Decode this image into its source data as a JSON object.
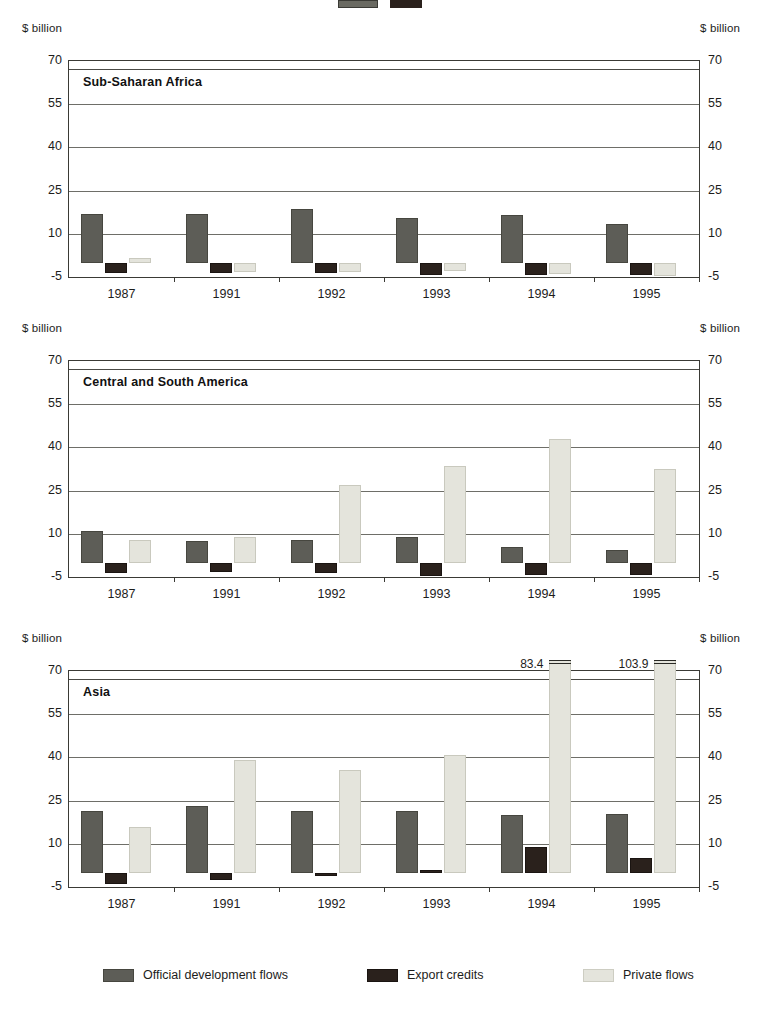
{
  "figure": {
    "unit_label_left": "$ billion",
    "unit_label_right": "$ billion",
    "top_marker": {
      "swatch_a": "odf-swatch",
      "swatch_b": "export-swatch"
    }
  },
  "legend": {
    "position": "bottom",
    "items": [
      {
        "key": "odf",
        "label": "Official development flows",
        "color": "#5d5d57"
      },
      {
        "key": "exp",
        "label": "Export credits",
        "color": "#2a211c"
      },
      {
        "key": "priv",
        "label": "Private flows",
        "color": "#e4e4dc"
      }
    ]
  },
  "axis": {
    "yticks": [
      70,
      55,
      40,
      25,
      10,
      -5
    ],
    "ytick_labels": [
      "70",
      "55",
      "40",
      "25",
      "10",
      "-5"
    ],
    "ylim": [
      -5,
      70
    ],
    "categories": [
      "1987",
      "1991",
      "1992",
      "1993",
      "1994",
      "1995"
    ],
    "ylabel": "$ billion",
    "grid": true
  },
  "chart_data": [
    {
      "type": "bar",
      "title": "Sub-Saharan Africa",
      "xlabel": "",
      "ylabel": "$ billion",
      "ylim": [
        -5,
        70
      ],
      "yticks": [
        70,
        55,
        40,
        25,
        10,
        -5
      ],
      "grid": true,
      "legend_position": "bottom",
      "categories": [
        "1987",
        "1991",
        "1992",
        "1993",
        "1994",
        "1995"
      ],
      "series": [
        {
          "name": "Official development flows",
          "color": "#5d5d57",
          "values": [
            17.0,
            17.0,
            18.5,
            15.5,
            16.5,
            13.5
          ]
        },
        {
          "name": "Export credits",
          "color": "#2a211c",
          "values": [
            -3.7,
            -3.7,
            -3.6,
            -4.2,
            -4.4,
            -4.3
          ]
        },
        {
          "name": "Private flows",
          "color": "#e4e4dc",
          "values": [
            1.5,
            -3.1,
            -3.3,
            -2.8,
            -4.1,
            -4.5
          ]
        }
      ]
    },
    {
      "type": "bar",
      "title": "Central and South America",
      "xlabel": "",
      "ylabel": "$ billion",
      "ylim": [
        -5,
        70
      ],
      "yticks": [
        70,
        55,
        40,
        25,
        10,
        -5
      ],
      "grid": true,
      "legend_position": "bottom",
      "categories": [
        "1987",
        "1991",
        "1992",
        "1993",
        "1994",
        "1995"
      ],
      "series": [
        {
          "name": "Official development flows",
          "color": "#5d5d57",
          "values": [
            11.0,
            7.5,
            8.0,
            9.0,
            5.5,
            4.5
          ]
        },
        {
          "name": "Export credits",
          "color": "#2a211c",
          "values": [
            -3.7,
            -3.3,
            -3.6,
            -4.6,
            -4.3,
            -4.3
          ]
        },
        {
          "name": "Private flows",
          "color": "#e4e4dc",
          "values": [
            8.0,
            9.0,
            27.0,
            33.5,
            43.0,
            32.5
          ]
        }
      ]
    },
    {
      "type": "bar",
      "title": "Asia",
      "xlabel": "",
      "ylabel": "$ billion",
      "ylim": [
        -5,
        70
      ],
      "yticks": [
        70,
        55,
        40,
        25,
        10,
        -5
      ],
      "grid": true,
      "legend_position": "bottom",
      "categories": [
        "1987",
        "1991",
        "1992",
        "1993",
        "1994",
        "1995"
      ],
      "series": [
        {
          "name": "Official development flows",
          "color": "#5d5d57",
          "values": [
            21.5,
            23.0,
            21.5,
            21.5,
            20.0,
            20.5
          ]
        },
        {
          "name": "Export credits",
          "color": "#2a211c",
          "values": [
            -3.9,
            -2.6,
            -1.2,
            1.0,
            9.0,
            5.0
          ]
        },
        {
          "name": "Private flows",
          "color": "#e4e4dc",
          "values": [
            16.0,
            39.0,
            35.5,
            41.0,
            83.4,
            103.9
          ]
        }
      ],
      "annotations": [
        {
          "text": "83.4",
          "category": "1994",
          "series": "Private flows",
          "value": 83.4,
          "broken_axis": true
        },
        {
          "text": "103.9",
          "category": "1995",
          "series": "Private flows",
          "value": 103.9,
          "broken_axis": true
        }
      ]
    }
  ]
}
